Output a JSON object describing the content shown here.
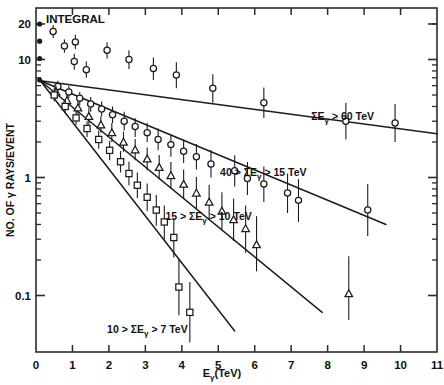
{
  "chart_data": {
    "type": "scatter",
    "title": "INTEGRAL",
    "xlabel": "E",
    "xlabel_sub": "γ",
    "xlabel_unit": "(TeV)",
    "ylabel": "NO. OF γ RAYS/EVENT",
    "xlim": [
      0,
      11
    ],
    "ylim": [
      0.035,
      27
    ],
    "yscale": "log",
    "xscale": "linear",
    "grid": false,
    "legend_position": "inline-annotations",
    "xticks": [
      "0",
      "1",
      "2",
      "3",
      "4",
      "5",
      "6",
      "7",
      "8",
      "9",
      "10",
      "11"
    ],
    "xtick_values": [
      0,
      1,
      2,
      3,
      4,
      5,
      6,
      7,
      8,
      9,
      10,
      11
    ],
    "yticks": [
      "20",
      "10",
      "1",
      "0.1"
    ],
    "ytick_values": [
      20,
      10,
      1,
      0.1
    ],
    "series": [
      {
        "name": "ΣEγ > 60 TeV",
        "annotation": "ΣEγ > 60 TeV",
        "annotation_x": 7.55,
        "annotation_y": 3.05,
        "marker": "open-circle",
        "fit_line": {
          "x0": 0.12,
          "y0": 6.6,
          "x1": 11.0,
          "y1": 2.35
        },
        "points": [
          {
            "x": 0.1,
            "y": 20.0,
            "yerr_lo": 20.0,
            "yerr_hi": 20.0,
            "filled": true
          },
          {
            "x": 0.1,
            "y": 14.3,
            "yerr_lo": 14.3,
            "yerr_hi": 14.3,
            "filled": true
          },
          {
            "x": 0.1,
            "y": 10.2,
            "yerr_lo": 10.2,
            "yerr_hi": 10.2,
            "filled": true
          },
          {
            "x": 0.1,
            "y": 6.7,
            "yerr_lo": 6.7,
            "yerr_hi": 6.7,
            "filled": true
          },
          {
            "x": 0.47,
            "y": 17.3,
            "yerr_lo": 15.2,
            "yerr_hi": 19.6
          },
          {
            "x": 0.78,
            "y": 13.0,
            "yerr_lo": 11.4,
            "yerr_hi": 14.8
          },
          {
            "x": 1.08,
            "y": 14.1,
            "yerr_lo": 12.3,
            "yerr_hi": 16.2
          },
          {
            "x": 1.05,
            "y": 9.6,
            "yerr_lo": 8.2,
            "yerr_hi": 11.2
          },
          {
            "x": 1.38,
            "y": 8.2,
            "yerr_lo": 7.0,
            "yerr_hi": 9.6
          },
          {
            "x": 1.95,
            "y": 12.0,
            "yerr_lo": 10.2,
            "yerr_hi": 14.0
          },
          {
            "x": 2.55,
            "y": 10.0,
            "yerr_lo": 8.3,
            "yerr_hi": 12.0
          },
          {
            "x": 3.22,
            "y": 8.4,
            "yerr_lo": 6.7,
            "yerr_hi": 10.4
          },
          {
            "x": 3.85,
            "y": 7.4,
            "yerr_lo": 5.7,
            "yerr_hi": 9.5
          },
          {
            "x": 4.85,
            "y": 5.7,
            "yerr_lo": 4.3,
            "yerr_hi": 7.5
          },
          {
            "x": 6.25,
            "y": 4.3,
            "yerr_lo": 3.2,
            "yerr_hi": 5.8
          },
          {
            "x": 8.5,
            "y": 3.0,
            "yerr_lo": 2.1,
            "yerr_hi": 4.3
          },
          {
            "x": 9.85,
            "y": 2.9,
            "yerr_lo": 2.0,
            "yerr_hi": 4.2
          }
        ]
      },
      {
        "name": "40 > ΣEγ > 15 TeV",
        "annotation": "40 > ΣEγ > 15 TeV",
        "annotation_x": 5.05,
        "annotation_y": 1.02,
        "marker": "open-circle",
        "fit_line": {
          "x0": 0.12,
          "y0": 6.6,
          "x1": 9.6,
          "y1": 0.4
        },
        "points": [
          {
            "x": 0.6,
            "y": 5.9,
            "yerr_lo": 5.3,
            "yerr_hi": 6.6
          },
          {
            "x": 0.9,
            "y": 5.3,
            "yerr_lo": 4.7,
            "yerr_hi": 6.0
          },
          {
            "x": 1.2,
            "y": 4.7,
            "yerr_lo": 4.1,
            "yerr_hi": 5.3
          },
          {
            "x": 1.5,
            "y": 4.2,
            "yerr_lo": 3.6,
            "yerr_hi": 4.8
          },
          {
            "x": 1.8,
            "y": 3.8,
            "yerr_lo": 3.3,
            "yerr_hi": 4.4
          },
          {
            "x": 2.1,
            "y": 3.4,
            "yerr_lo": 2.9,
            "yerr_hi": 4.0
          },
          {
            "x": 2.42,
            "y": 3.0,
            "yerr_lo": 2.5,
            "yerr_hi": 3.6
          },
          {
            "x": 2.72,
            "y": 2.7,
            "yerr_lo": 2.2,
            "yerr_hi": 3.2
          },
          {
            "x": 3.05,
            "y": 2.4,
            "yerr_lo": 2.0,
            "yerr_hi": 2.9
          },
          {
            "x": 3.35,
            "y": 2.1,
            "yerr_lo": 1.7,
            "yerr_hi": 2.6
          },
          {
            "x": 3.7,
            "y": 1.9,
            "yerr_lo": 1.5,
            "yerr_hi": 2.3
          },
          {
            "x": 4.05,
            "y": 1.67,
            "yerr_lo": 1.33,
            "yerr_hi": 2.1
          },
          {
            "x": 4.4,
            "y": 1.5,
            "yerr_lo": 1.17,
            "yerr_hi": 1.92
          },
          {
            "x": 4.8,
            "y": 1.3,
            "yerr_lo": 1.0,
            "yerr_hi": 1.7
          },
          {
            "x": 5.45,
            "y": 1.14,
            "yerr_lo": 0.84,
            "yerr_hi": 1.54
          },
          {
            "x": 5.8,
            "y": 0.98,
            "yerr_lo": 0.71,
            "yerr_hi": 1.35
          },
          {
            "x": 6.25,
            "y": 0.88,
            "yerr_lo": 0.62,
            "yerr_hi": 1.24
          },
          {
            "x": 6.9,
            "y": 0.74,
            "yerr_lo": 0.5,
            "yerr_hi": 1.08
          },
          {
            "x": 7.2,
            "y": 0.64,
            "yerr_lo": 0.42,
            "yerr_hi": 0.97
          },
          {
            "x": 9.1,
            "y": 0.53,
            "yerr_lo": 0.32,
            "yerr_hi": 0.88
          }
        ]
      },
      {
        "name": "15 > ΣEγ > 10 TeV",
        "annotation": "15 > ΣEγ > 10 TeV",
        "annotation_x": 3.55,
        "annotation_y": 0.44,
        "marker": "open-triangle",
        "fit_line": {
          "x0": 0.12,
          "y0": 6.6,
          "x1": 7.85,
          "y1": 0.072
        },
        "points": [
          {
            "x": 0.55,
            "y": 5.3,
            "yerr_lo": 4.7,
            "yerr_hi": 6.0
          },
          {
            "x": 0.85,
            "y": 4.5,
            "yerr_lo": 4.0,
            "yerr_hi": 5.1
          },
          {
            "x": 1.15,
            "y": 3.9,
            "yerr_lo": 3.4,
            "yerr_hi": 4.5
          },
          {
            "x": 1.45,
            "y": 3.3,
            "yerr_lo": 2.8,
            "yerr_hi": 3.9
          },
          {
            "x": 1.78,
            "y": 2.8,
            "yerr_lo": 2.4,
            "yerr_hi": 3.3
          },
          {
            "x": 2.08,
            "y": 2.4,
            "yerr_lo": 2.0,
            "yerr_hi": 2.9
          },
          {
            "x": 2.4,
            "y": 2.0,
            "yerr_lo": 1.65,
            "yerr_hi": 2.45
          },
          {
            "x": 2.72,
            "y": 1.72,
            "yerr_lo": 1.4,
            "yerr_hi": 2.12
          },
          {
            "x": 3.05,
            "y": 1.44,
            "yerr_lo": 1.15,
            "yerr_hi": 1.8
          },
          {
            "x": 3.38,
            "y": 1.22,
            "yerr_lo": 0.96,
            "yerr_hi": 1.55
          },
          {
            "x": 3.7,
            "y": 1.04,
            "yerr_lo": 0.8,
            "yerr_hi": 1.35
          },
          {
            "x": 4.05,
            "y": 0.88,
            "yerr_lo": 0.66,
            "yerr_hi": 1.17
          },
          {
            "x": 4.4,
            "y": 0.74,
            "yerr_lo": 0.54,
            "yerr_hi": 1.01
          },
          {
            "x": 4.75,
            "y": 0.62,
            "yerr_lo": 0.44,
            "yerr_hi": 0.87
          },
          {
            "x": 5.1,
            "y": 0.52,
            "yerr_lo": 0.36,
            "yerr_hi": 0.75
          },
          {
            "x": 5.42,
            "y": 0.44,
            "yerr_lo": 0.29,
            "yerr_hi": 0.66
          },
          {
            "x": 5.75,
            "y": 0.37,
            "yerr_lo": 0.23,
            "yerr_hi": 0.58
          },
          {
            "x": 6.05,
            "y": 0.27,
            "yerr_lo": 0.16,
            "yerr_hi": 0.47
          },
          {
            "x": 8.58,
            "y": 0.104,
            "yerr_lo": 0.062,
            "yerr_hi": 0.215
          }
        ]
      },
      {
        "name": "10 > ΣEγ > 7 TeV",
        "annotation": "10 > ΣEγ > 7 TeV",
        "annotation_x": 1.95,
        "annotation_y": 0.048,
        "marker": "open-square",
        "fit_line": {
          "x0": 0.12,
          "y0": 6.6,
          "x1": 5.45,
          "y1": 0.05
        },
        "points": [
          {
            "x": 0.5,
            "y": 5.0,
            "yerr_lo": 4.4,
            "yerr_hi": 5.7
          },
          {
            "x": 0.8,
            "y": 4.0,
            "yerr_lo": 3.5,
            "yerr_hi": 4.6
          },
          {
            "x": 1.1,
            "y": 3.2,
            "yerr_lo": 2.8,
            "yerr_hi": 3.7
          },
          {
            "x": 1.4,
            "y": 2.6,
            "yerr_lo": 2.2,
            "yerr_hi": 3.0
          },
          {
            "x": 1.72,
            "y": 2.1,
            "yerr_lo": 1.75,
            "yerr_hi": 2.5
          },
          {
            "x": 2.02,
            "y": 1.7,
            "yerr_lo": 1.4,
            "yerr_hi": 2.05
          },
          {
            "x": 2.32,
            "y": 1.36,
            "yerr_lo": 1.1,
            "yerr_hi": 1.68
          },
          {
            "x": 2.55,
            "y": 1.08,
            "yerr_lo": 0.86,
            "yerr_hi": 1.36
          },
          {
            "x": 2.78,
            "y": 0.86,
            "yerr_lo": 0.67,
            "yerr_hi": 1.1
          },
          {
            "x": 3.05,
            "y": 0.68,
            "yerr_lo": 0.52,
            "yerr_hi": 0.89
          },
          {
            "x": 3.3,
            "y": 0.53,
            "yerr_lo": 0.39,
            "yerr_hi": 0.71
          },
          {
            "x": 3.52,
            "y": 0.42,
            "yerr_lo": 0.3,
            "yerr_hi": 0.58
          },
          {
            "x": 3.78,
            "y": 0.31,
            "yerr_lo": 0.21,
            "yerr_hi": 0.45
          },
          {
            "x": 3.92,
            "y": 0.118,
            "yerr_lo": 0.068,
            "yerr_hi": 0.205
          },
          {
            "x": 4.22,
            "y": 0.072,
            "yerr_lo": 0.04,
            "yerr_hi": 0.13
          }
        ]
      }
    ]
  }
}
